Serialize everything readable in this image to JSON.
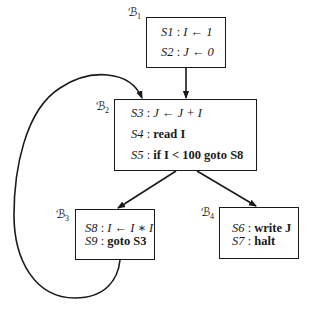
{
  "diagram": {
    "type": "control-flow-graph",
    "blocks": [
      {
        "id": "B1",
        "label": "ℬ",
        "subscript": "1",
        "statements": [
          {
            "id": "S1",
            "sep": " : ",
            "code": "I ← 1"
          },
          {
            "id": "S2",
            "sep": " : ",
            "code": "J ← 0"
          }
        ]
      },
      {
        "id": "B2",
        "label": "ℬ",
        "subscript": "2",
        "statements": [
          {
            "id": "S3",
            "sep": " : ",
            "code": "J ← J + I"
          },
          {
            "id": "S4",
            "sep": " : ",
            "code": "read I"
          },
          {
            "id": "S5",
            "sep": " : ",
            "code": "if I < 100 goto S8"
          }
        ]
      },
      {
        "id": "B3",
        "label": "ℬ",
        "subscript": "3",
        "statements": [
          {
            "id": "S8",
            "sep": " : ",
            "code": "I ← I ∗ I"
          },
          {
            "id": "S9",
            "sep": " : ",
            "code": "goto S3"
          }
        ]
      },
      {
        "id": "B4",
        "label": "ℬ",
        "subscript": "4",
        "statements": [
          {
            "id": "S6",
            "sep": " : ",
            "code": "write J"
          },
          {
            "id": "S7",
            "sep": " : ",
            "code": "halt"
          }
        ]
      }
    ],
    "edges": [
      {
        "from": "B1",
        "to": "B2"
      },
      {
        "from": "B2",
        "to": "B3"
      },
      {
        "from": "B2",
        "to": "B4"
      },
      {
        "from": "B3",
        "to": "B2"
      }
    ],
    "colors": {
      "ink": "#1a1a1a",
      "background": "#ffffff"
    }
  }
}
